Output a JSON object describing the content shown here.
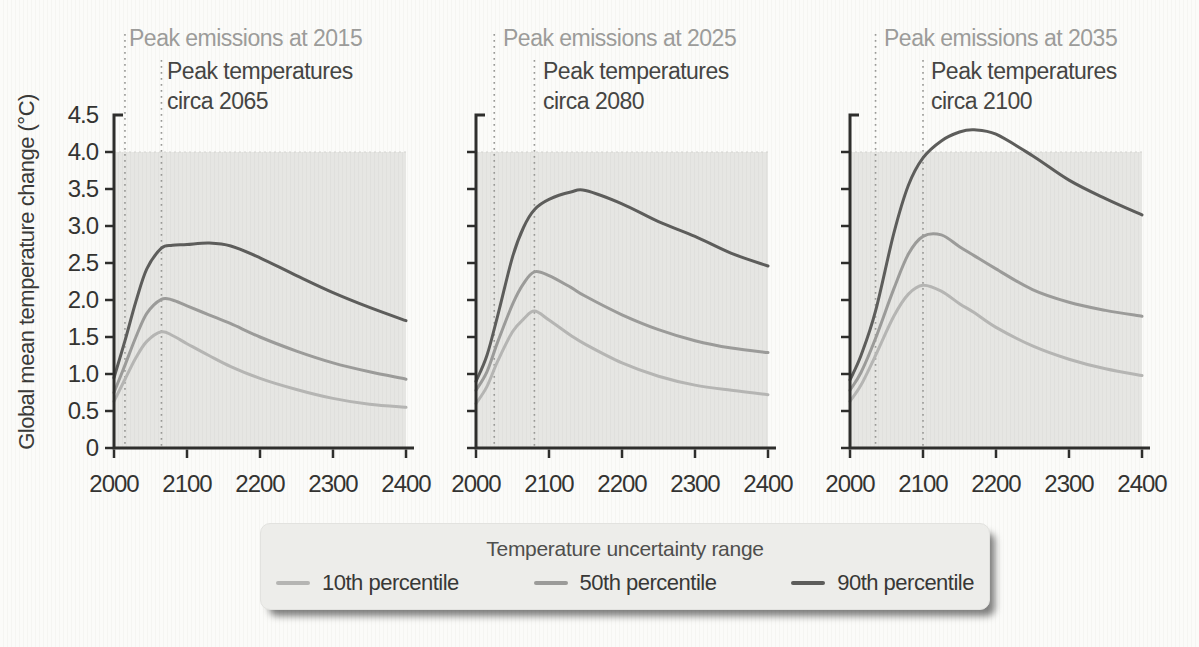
{
  "y_axis": {
    "label": "Global mean temperature change (°C)",
    "range": [
      0,
      4.5
    ],
    "ticks": [
      0,
      0.5,
      1.0,
      1.5,
      2.0,
      2.5,
      3.0,
      3.5,
      4.0,
      4.5
    ],
    "tick_labels": [
      "0",
      "0.5",
      "1.0",
      "1.5",
      "2.0",
      "2.5",
      "3.0",
      "3.5",
      "4.0",
      "4.5"
    ]
  },
  "x_axis": {
    "range": [
      2000,
      2400
    ],
    "ticks": [
      2000,
      2100,
      2200,
      2300,
      2400
    ],
    "tick_labels": [
      "2000",
      "2100",
      "2200",
      "2300",
      "2400"
    ]
  },
  "colors": {
    "percentile_10": "#b5b5b3",
    "percentile_50": "#9b9b99",
    "percentile_90": "#5d5d5b",
    "axis": "#2e2e2c",
    "shading": "#e6e6e3",
    "shading_stripe": "#e0e0dd",
    "dotted_line": "#999996",
    "title_gray": "#9c9c9a",
    "text_dark": "#3c3c3a",
    "legend_bg": "#ededea"
  },
  "legend": {
    "title": "Temperature uncertainty range",
    "entries": [
      {
        "label": "10th percentile",
        "color": "#b5b5b3"
      },
      {
        "label": "50th percentile",
        "color": "#9b9b99"
      },
      {
        "label": "90th percentile",
        "color": "#5d5d5b"
      }
    ]
  },
  "chart_data": [
    {
      "type": "line",
      "emissions_label": "Peak emissions at 2015",
      "peak_label_line1": "Peak temperatures",
      "peak_label_line2": "circa 2065",
      "peak_emissions_year": 2015,
      "peak_temperature_year": 2065,
      "xlim": [
        2000,
        2400
      ],
      "ylim": [
        0,
        4.5
      ],
      "shaded_region_top": 4.0,
      "x": [
        2000,
        2015,
        2030,
        2045,
        2065,
        2080,
        2100,
        2130,
        2160,
        2200,
        2250,
        2300,
        2350,
        2400
      ],
      "series": [
        {
          "name": "10th percentile",
          "color": "#b5b5b3",
          "values": [
            0.63,
            0.93,
            1.22,
            1.44,
            1.57,
            1.52,
            1.41,
            1.25,
            1.1,
            0.94,
            0.79,
            0.67,
            0.59,
            0.55
          ]
        },
        {
          "name": "50th percentile",
          "color": "#9b9b99",
          "values": [
            0.75,
            1.12,
            1.5,
            1.82,
            2.01,
            2.0,
            1.92,
            1.8,
            1.68,
            1.5,
            1.31,
            1.15,
            1.03,
            0.93
          ]
        },
        {
          "name": "90th percentile",
          "color": "#5d5d5b",
          "values": [
            0.95,
            1.45,
            1.98,
            2.42,
            2.7,
            2.74,
            2.75,
            2.77,
            2.73,
            2.57,
            2.33,
            2.1,
            1.9,
            1.72
          ]
        }
      ]
    },
    {
      "type": "line",
      "emissions_label": "Peak emissions at 2025",
      "peak_label_line1": "Peak temperatures",
      "peak_label_line2": "circa 2080",
      "peak_emissions_year": 2025,
      "peak_temperature_year": 2080,
      "xlim": [
        2000,
        2400
      ],
      "ylim": [
        0,
        4.5
      ],
      "shaded_region_top": 4.0,
      "x": [
        2000,
        2015,
        2030,
        2050,
        2065,
        2080,
        2100,
        2130,
        2150,
        2200,
        2250,
        2300,
        2350,
        2400
      ],
      "series": [
        {
          "name": "10th percentile",
          "color": "#b5b5b3",
          "values": [
            0.6,
            0.83,
            1.18,
            1.57,
            1.74,
            1.85,
            1.73,
            1.52,
            1.4,
            1.15,
            0.97,
            0.85,
            0.78,
            0.72
          ]
        },
        {
          "name": "50th percentile",
          "color": "#9b9b99",
          "values": [
            0.78,
            1.03,
            1.44,
            1.94,
            2.22,
            2.38,
            2.33,
            2.17,
            2.05,
            1.8,
            1.6,
            1.45,
            1.35,
            1.29
          ]
        },
        {
          "name": "90th percentile",
          "color": "#5d5d5b",
          "values": [
            0.9,
            1.25,
            1.8,
            2.58,
            2.98,
            3.22,
            3.36,
            3.46,
            3.48,
            3.3,
            3.06,
            2.86,
            2.63,
            2.46
          ]
        }
      ]
    },
    {
      "type": "line",
      "emissions_label": "Peak emissions at 2035",
      "peak_label_line1": "Peak temperatures",
      "peak_label_line2": "circa 2100",
      "peak_emissions_year": 2035,
      "peak_temperature_year": 2100,
      "xlim": [
        2000,
        2400
      ],
      "ylim": [
        0,
        4.5
      ],
      "shaded_region_top": 4.0,
      "x": [
        2000,
        2015,
        2035,
        2060,
        2080,
        2100,
        2125,
        2150,
        2170,
        2200,
        2250,
        2300,
        2350,
        2400
      ],
      "series": [
        {
          "name": "10th percentile",
          "color": "#b5b5b3",
          "values": [
            0.63,
            0.85,
            1.25,
            1.78,
            2.08,
            2.2,
            2.12,
            1.95,
            1.83,
            1.63,
            1.38,
            1.2,
            1.07,
            0.98
          ]
        },
        {
          "name": "50th percentile",
          "color": "#9b9b99",
          "values": [
            0.78,
            1.02,
            1.48,
            2.15,
            2.62,
            2.86,
            2.88,
            2.72,
            2.6,
            2.42,
            2.14,
            1.97,
            1.86,
            1.78
          ]
        },
        {
          "name": "90th percentile",
          "color": "#5d5d5b",
          "values": [
            0.92,
            1.25,
            1.85,
            2.9,
            3.55,
            3.92,
            4.15,
            4.27,
            4.3,
            4.24,
            3.95,
            3.62,
            3.37,
            3.15
          ]
        }
      ]
    }
  ]
}
